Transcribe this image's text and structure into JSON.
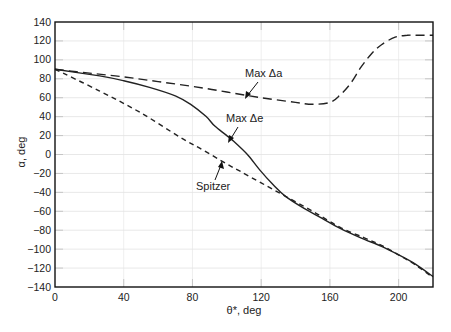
{
  "chart_data": {
    "type": "line",
    "title": "",
    "xlabel": "θ*, deg",
    "ylabel": "α, deg",
    "xlim": [
      0,
      220
    ],
    "ylim": [
      -140,
      140
    ],
    "xticks": [
      0,
      40,
      80,
      120,
      160,
      200
    ],
    "yticks": [
      140,
      120,
      100,
      80,
      60,
      40,
      20,
      0,
      -20,
      -40,
      -60,
      -80,
      -100,
      -120,
      -140
    ],
    "grid": "faint light-gray gridlines at tick positions",
    "legend": "none (curves labeled by arrow annotations)",
    "series": [
      {
        "name": "Max Δa",
        "style": "long-dash",
        "x": [
          0,
          20,
          40,
          60,
          80,
          100,
          120,
          140,
          150,
          160,
          166,
          172,
          178,
          184,
          190,
          198,
          205,
          212,
          220
        ],
        "y": [
          90,
          86,
          82,
          77,
          72,
          66,
          60,
          55,
          53,
          55,
          63,
          75,
          92,
          106,
          116,
          124,
          126,
          126,
          126
        ]
      },
      {
        "name": "Max Δe",
        "style": "solid",
        "x": [
          0,
          26,
          40,
          55,
          70,
          79,
          88,
          93,
          100,
          104,
          112,
          119,
          127,
          134,
          145,
          155,
          166,
          178,
          190,
          200,
          210,
          220
        ],
        "y": [
          90,
          83,
          78,
          71,
          62,
          53,
          40,
          30,
          20,
          14,
          0,
          -16,
          -32,
          -44,
          -57,
          -67,
          -78,
          -88,
          -97,
          -106,
          -116,
          -129
        ]
      },
      {
        "name": "Spitzer",
        "style": "short-dash",
        "x": [
          0,
          26,
          50,
          73,
          84,
          100,
          108,
          120,
          134,
          150,
          166,
          180,
          190,
          200,
          210,
          220
        ],
        "y": [
          90,
          67,
          44,
          18,
          7,
          -10,
          -18,
          -30,
          -44,
          -60,
          -77,
          -88,
          -96,
          -106,
          -117,
          -130
        ]
      }
    ],
    "annotations": [
      {
        "text": "Max Δa",
        "arrow_to": [
          107,
          62
        ]
      },
      {
        "text": "Max Δe",
        "arrow_to": [
          101,
          17
        ]
      },
      {
        "text": "Spitzer",
        "arrow_to": [
          92,
          -6
        ]
      }
    ]
  },
  "axes": {
    "xlabel": "θ*, deg",
    "ylabel": "α, deg"
  },
  "labels": {
    "max_da": "Max Δa",
    "max_de": "Max Δe",
    "spitzer": "Spitzer"
  },
  "colors": {
    "line": "#222222",
    "grid": "#e2e2e2",
    "frame": "#111111"
  }
}
